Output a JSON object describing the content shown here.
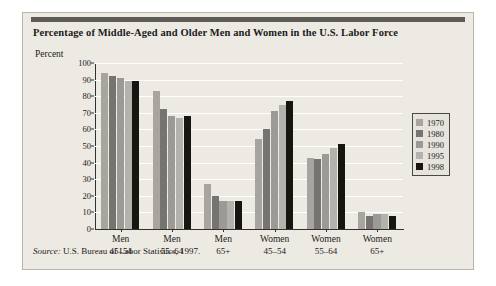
{
  "figure": {
    "title": "Percentage of Middle-Aged and Older Men and Women in the U.S. Labor Force",
    "y_axis_label": "Percent",
    "source_prefix": "Source:",
    "source_text": " U.S. Bureau of Labor Statistics, 1997."
  },
  "chart_data": {
    "type": "bar",
    "title": "Percentage of Middle-Aged and Older Men and Women in the U.S. Labor Force",
    "xlabel": "",
    "ylabel": "Percent",
    "ylim": [
      0,
      100
    ],
    "yticks": [
      0,
      10,
      20,
      30,
      40,
      50,
      60,
      70,
      80,
      90,
      100
    ],
    "grid": true,
    "legend_position": "right",
    "categories": [
      "Men 45–54",
      "Men 55–64",
      "Men 65+",
      "Women 45–54",
      "Women 55–64",
      "Women 65+"
    ],
    "category_lines": [
      [
        "Men",
        "45–54"
      ],
      [
        "Men",
        "55–64"
      ],
      [
        "Men",
        "65+"
      ],
      [
        "Women",
        "45–54"
      ],
      [
        "Women",
        "55–64"
      ],
      [
        "Women",
        "65+"
      ]
    ],
    "series": [
      {
        "name": "1970",
        "color": "#a8a5a0",
        "values": [
          94,
          83,
          27,
          54,
          43,
          10
        ]
      },
      {
        "name": "1980",
        "color": "#767470",
        "values": [
          92,
          72,
          20,
          60,
          42,
          8
        ]
      },
      {
        "name": "1990",
        "color": "#9c9a95",
        "values": [
          91,
          68,
          17,
          71,
          45,
          9
        ]
      },
      {
        "name": "1995",
        "color": "#b4b2ad",
        "values": [
          89,
          67,
          17,
          75,
          49,
          9
        ]
      },
      {
        "name": "1998",
        "color": "#17150f",
        "values": [
          89,
          68,
          17,
          77,
          51,
          8
        ]
      }
    ]
  },
  "colors": {
    "panel_background": "#edeae3",
    "header_bar": "#5f5c57",
    "axis": "#33312e",
    "gridline": "#ffffff",
    "text": "#1b1b1b"
  }
}
